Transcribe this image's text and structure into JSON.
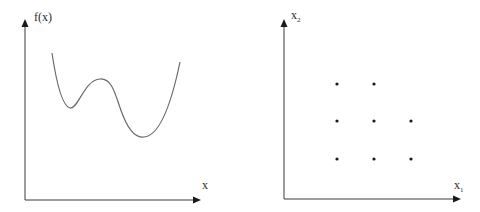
{
  "left_diagram": {
    "title": "objective function",
    "y_axis_label": "f(x)",
    "x_axis_label": "x",
    "curve": {
      "description": "1-D function with a local minimum and a lower global minimum",
      "points": [
        [
          52,
          53
        ],
        [
          58,
          80
        ],
        [
          64,
          100
        ],
        [
          70,
          108
        ],
        [
          78,
          100
        ],
        [
          88,
          84
        ],
        [
          100,
          79
        ],
        [
          110,
          84
        ],
        [
          118,
          100
        ],
        [
          126,
          122
        ],
        [
          134,
          134
        ],
        [
          142,
          137
        ],
        [
          152,
          134
        ],
        [
          162,
          120
        ],
        [
          172,
          95
        ],
        [
          180,
          62
        ]
      ]
    },
    "colors": {
      "axis": "#3a3a3a",
      "curve": "#6a6a6a"
    }
  },
  "right_diagram": {
    "title": "grid search sample points",
    "y_axis_label": "x",
    "y_axis_sub": "2",
    "x_axis_label": "x",
    "x_axis_sub": "1",
    "grid_points": [
      {
        "col": 1,
        "row": 3
      },
      {
        "col": 2,
        "row": 3
      },
      {
        "col": 1,
        "row": 2
      },
      {
        "col": 2,
        "row": 2
      },
      {
        "col": 3,
        "row": 2
      },
      {
        "col": 1,
        "row": 1
      },
      {
        "col": 2,
        "row": 1
      },
      {
        "col": 3,
        "row": 1
      }
    ],
    "colors": {
      "axis": "#3a3a3a",
      "dot": "#1a1a1a"
    }
  }
}
